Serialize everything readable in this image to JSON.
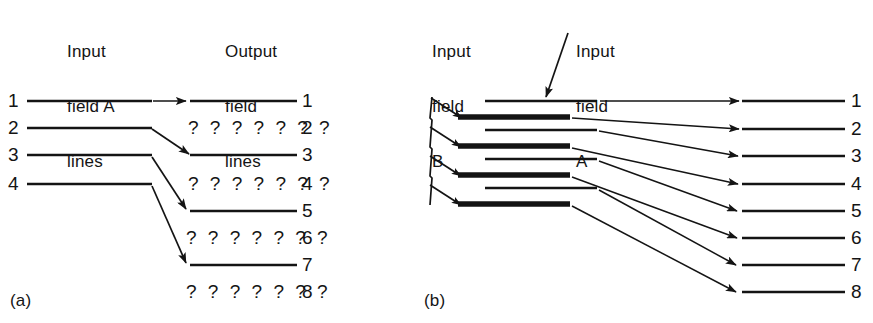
{
  "figure": {
    "kind": "diagram",
    "ink_color": "#141414",
    "background": "#ffffff"
  },
  "panel_a": {
    "caption": "(a)",
    "input_header": {
      "line1": "Input",
      "line2": "field A",
      "line3": "lines"
    },
    "output_header": {
      "line1": "Output",
      "line2": "field",
      "line3": "lines"
    },
    "input_numbers": [
      "1",
      "2",
      "3",
      "4"
    ],
    "output_numbers": [
      "1",
      "2",
      "3",
      "4",
      "5",
      "6",
      "7",
      "8"
    ],
    "unknown_marker": "? ? ? ? ? ? ?",
    "unknown_rows": [
      "2",
      "4",
      "6",
      "8"
    ],
    "solid_rows": [
      "1",
      "3",
      "5",
      "7"
    ],
    "mapping": [
      {
        "from": "1",
        "to": "1",
        "style": "horizontal"
      },
      {
        "from": "2",
        "to": "3",
        "style": "diagonal"
      },
      {
        "from": "3",
        "to": "5",
        "style": "diagonal"
      },
      {
        "from": "4",
        "to": "7",
        "style": "diagonal"
      }
    ]
  },
  "panel_b": {
    "caption": "(b)",
    "field_b_header": {
      "line1": "Input",
      "line2": "field",
      "line3": "B"
    },
    "field_a_header": {
      "line1": "Input",
      "line2": "field",
      "line3": "A"
    },
    "output_numbers": [
      "1",
      "2",
      "3",
      "4",
      "5",
      "6",
      "7",
      "8"
    ],
    "field_a_line_count": 4,
    "field_b_line_count": 4,
    "field_a_style": "thin",
    "field_b_style": "thick",
    "mapping": [
      {
        "from_field": "A",
        "from_index": 1,
        "to": "1"
      },
      {
        "from_field": "B",
        "from_index": 1,
        "to": "2"
      },
      {
        "from_field": "A",
        "from_index": 2,
        "to": "3"
      },
      {
        "from_field": "B",
        "from_index": 2,
        "to": "4"
      },
      {
        "from_field": "A",
        "from_index": 3,
        "to": "5"
      },
      {
        "from_field": "B",
        "from_index": 3,
        "to": "6"
      },
      {
        "from_field": "A",
        "from_index": 4,
        "to": "7"
      },
      {
        "from_field": "B",
        "from_index": 4,
        "to": "8"
      }
    ]
  }
}
